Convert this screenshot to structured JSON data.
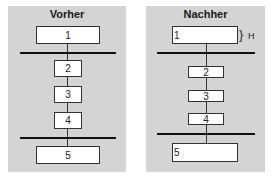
{
  "diagram": {
    "panels": [
      {
        "title": "Vorher",
        "boxes": [
          "1",
          "2",
          "3",
          "4",
          "5"
        ]
      },
      {
        "title": "Nachher",
        "boxes": [
          "1",
          "2",
          "3",
          "4",
          "5"
        ],
        "annotation": {
          "brace": "}",
          "label": "H"
        }
      }
    ]
  },
  "colors": {
    "panel_bg": "#d4d4d4",
    "box_bg": "#ffffff",
    "line": "#111111"
  }
}
